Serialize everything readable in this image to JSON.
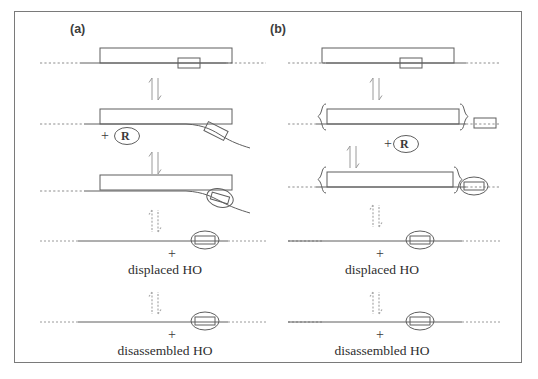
{
  "figure": {
    "background_color": "#ffffff",
    "border_color": "#7a7a7a",
    "line_color": "#555555",
    "dna_color": "#6b6b6b",
    "text_color": "#2e2e2e"
  },
  "panels": [
    {
      "id": "a",
      "label": "(a)",
      "rows": [
        {
          "name": "row-1-nucleosome-bound",
          "caption": "",
          "plus": "",
          "reagent": ""
        },
        {
          "name": "row-2-partial-peel",
          "caption": "",
          "plus": "+",
          "reagent": "R"
        },
        {
          "name": "row-3-peeled-ho",
          "caption": "",
          "plus": "",
          "reagent": ""
        },
        {
          "name": "row-4-displaced",
          "caption": "displaced HO",
          "plus": "+",
          "reagent": ""
        },
        {
          "name": "row-5-disassembled",
          "caption": "disassembled HO",
          "plus": "+",
          "reagent": ""
        }
      ]
    },
    {
      "id": "b",
      "label": "(b)",
      "rows": [
        {
          "name": "row-1-nucleosome-bound",
          "caption": "",
          "plus": "",
          "reagent": ""
        },
        {
          "name": "row-2-bracketed-released",
          "caption": "",
          "plus": "+",
          "reagent": "R"
        },
        {
          "name": "row-3-bracketed-ho",
          "caption": "",
          "plus": "",
          "reagent": ""
        },
        {
          "name": "row-4-displaced",
          "caption": "displaced HO",
          "plus": "+",
          "reagent": ""
        },
        {
          "name": "row-5-disassembled",
          "caption": "disassembled HO",
          "plus": "+",
          "reagent": ""
        }
      ]
    }
  ],
  "glyphs": {
    "equilibrium_arrow": "equilibrium-double-arrow",
    "hatched_arrow": "hatched-double-arrow",
    "histone_octamer": "histone-octamer-ellipse",
    "dna_line": "dna-strand",
    "protein_bar": "protein-bar",
    "bracket": "curly-bracket",
    "reagent_circle": "circled-R"
  }
}
